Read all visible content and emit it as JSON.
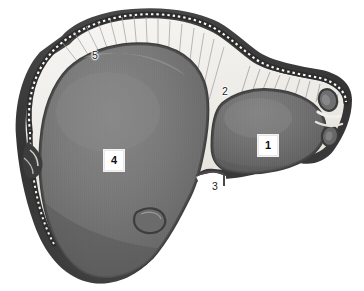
{
  "figure": {
    "view": "anterior",
    "background_color": "#ffffff",
    "canvas": {
      "width": 364,
      "height": 291
    }
  },
  "palette": {
    "background": "#ffffff",
    "lobe_fill_light": "#8d8d8d",
    "lobe_fill_mid": "#767676",
    "lobe_fill_dark": "#5f5f5f",
    "lobe_shadow": "#4a4a4a",
    "outer_rim_dark": "#3a3a3a",
    "outer_rim_darkest": "#2a2a2a",
    "ligament_pale": "#f2f0ec",
    "ligament_shade": "#d9d6d0",
    "fiber_stroke": "#9a9a9a",
    "bead_highlight": "#fbfbf8",
    "label_text": "#1c1c1c",
    "label_box_fill": "#ffffff",
    "label_box_border": "#e8e8e8"
  },
  "labels": [
    {
      "id": "label-1",
      "text": "1",
      "style": "boxed",
      "x": 258,
      "y": 135,
      "refers_to": "right-lobe",
      "description": "numbered callout on right lobe"
    },
    {
      "id": "label-2",
      "text": "2",
      "style": "plain",
      "x": 222,
      "y": 86,
      "refers_to": "falciform-ligament-margin",
      "description": "numbered callout at upper margin of right lobe"
    },
    {
      "id": "label-3",
      "text": "3",
      "style": "plain",
      "x": 212,
      "y": 181,
      "refers_to": "interlobar-notch",
      "description": "numbered callout at notch between lobes"
    },
    {
      "id": "label-4",
      "text": "4",
      "style": "boxed",
      "x": 104,
      "y": 150,
      "refers_to": "left-lobe",
      "description": "numbered callout on large left lobe"
    },
    {
      "id": "label-5",
      "text": "5",
      "style": "plain",
      "x": 92,
      "y": 50,
      "refers_to": "superior-fibrous-border",
      "description": "numbered callout on superior striated border"
    }
  ],
  "regions": [
    {
      "id": "outer-capsule",
      "name": "outer-capsule-rim",
      "fill": "#3a3a3a"
    },
    {
      "id": "beaded-margin",
      "name": "beaded-superior-margin",
      "fill": "#fbfbf8"
    },
    {
      "id": "pale-ligament-field",
      "name": "pale-ligament-field",
      "fill": "#f2f0ec"
    },
    {
      "id": "left-lobe",
      "name": "left-lobe-mass",
      "fill": "#767676"
    },
    {
      "id": "right-lobe",
      "name": "right-lobe-mass",
      "fill": "#767676"
    },
    {
      "id": "gallbladder-bulge",
      "name": "gallbladder-bulge",
      "fill": "#6a6a6a"
    },
    {
      "id": "right-tip-ovals",
      "name": "right-tip-ovals",
      "fill": "#6f6f6f"
    },
    {
      "id": "left-notch",
      "name": "left-border-notch",
      "fill": "#3c3c3c"
    }
  ]
}
